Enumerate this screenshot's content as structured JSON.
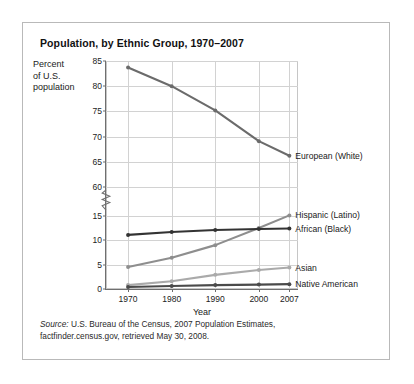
{
  "chart_data": {
    "type": "line",
    "title": "Population, by Ethnic Group, 1970–2007",
    "xlabel": "Year",
    "ylabel": "Percent of U.S. population",
    "ylabel_lines": [
      "Percent",
      "of U.S.",
      "population"
    ],
    "x": [
      1970,
      1980,
      1990,
      2000,
      2007
    ],
    "xtick_labels": [
      "1970",
      "1980",
      "1990",
      "2000",
      "2007"
    ],
    "ytick_labels_upper": [
      "85",
      "80",
      "75",
      "70",
      "65",
      "60"
    ],
    "ytick_values_upper": [
      85,
      80,
      75,
      70,
      65,
      60
    ],
    "ytick_labels_lower": [
      "15",
      "10",
      "5",
      "0"
    ],
    "ytick_values_lower": [
      15,
      10,
      5,
      0
    ],
    "axis_break": true,
    "axis_break_note": "y-axis broken between 60 and 15",
    "ylim_upper": [
      60,
      85
    ],
    "ylim_lower": [
      0,
      16
    ],
    "grid": true,
    "legend_position": "right-of-plot (direct line labels)",
    "series": [
      {
        "name": "European (White)",
        "values": [
          83.7,
          80.0,
          75.2,
          69.1,
          66.2
        ],
        "color": "#6b6b6b",
        "label_y_percent_units": 66.2
      },
      {
        "name": "Hispanic (Latino)",
        "values": [
          4.5,
          6.4,
          9.0,
          12.5,
          15.1
        ],
        "color": "#8e8e8e",
        "label_y_percent_units": 15.1
      },
      {
        "name": "African (Black)",
        "values": [
          11.1,
          11.7,
          12.1,
          12.3,
          12.4
        ],
        "color": "#333333",
        "label_y_percent_units": 12.4
      },
      {
        "name": "Asian",
        "values": [
          0.8,
          1.6,
          2.9,
          3.9,
          4.4
        ],
        "color": "#aaaaaa",
        "label_y_percent_units": 4.4
      },
      {
        "name": "Native American",
        "values": [
          0.4,
          0.6,
          0.8,
          0.9,
          1.0
        ],
        "color": "#4a4a4a",
        "label_y_percent_units": 1.0
      }
    ]
  },
  "source": {
    "prefix": "Source:",
    "line1": " U.S. Bureau of the Census, 2007 Population Estimates,",
    "line2": "factfinder.census.gov, retrieved May 30, 2008."
  },
  "colors": {
    "card_border": "#b9b9b9",
    "grid": "#d2d2d2",
    "axis": "#6f6f6f",
    "text": "#1a1a1a",
    "background": "#ffffff"
  }
}
